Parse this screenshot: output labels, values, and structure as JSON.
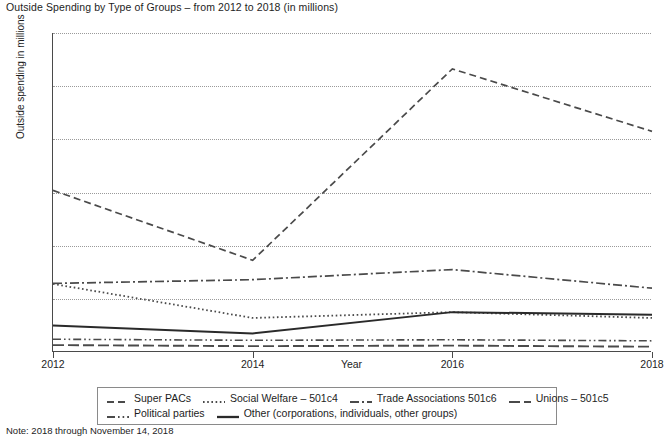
{
  "chart_data": {
    "type": "line",
    "title": "Outside Spending by Type of Groups – from 2012 to 2018 (in millions)",
    "xlabel": "Year",
    "ylabel": "Outside spending in millions",
    "note": "Note: 2018 through November 14, 2018",
    "x": [
      2012,
      2014,
      2016,
      2018
    ],
    "xlim": [
      2012,
      2018
    ],
    "ylim": [
      0,
      1200
    ],
    "x_ticks": [
      "2012",
      "2014",
      "2016",
      "2018"
    ],
    "y_ticks": [
      "$0",
      "$200",
      "$400",
      "$600",
      "$800",
      "$1000",
      "$1200"
    ],
    "y_tick_values": [
      0,
      200,
      400,
      600,
      800,
      1000,
      1200
    ],
    "grid": true,
    "legend_position": "bottom",
    "series": [
      {
        "name": "Super PACs",
        "style": "dashed",
        "color": "#4a4a4a",
        "values": [
          608,
          345,
          1065,
          830
        ]
      },
      {
        "name": "Social Welfare – 501c4",
        "style": "dotted",
        "color": "#4a4a4a",
        "values": [
          256,
          128,
          150,
          128
        ]
      },
      {
        "name": "Trade Associations 501c6",
        "style": "dash-dot",
        "color": "#4a4a4a",
        "values": [
          258,
          272,
          310,
          240
        ]
      },
      {
        "name": "Unions – 501c5",
        "style": "long-dash",
        "color": "#4a4a4a",
        "values": [
          26,
          22,
          24,
          20
        ]
      },
      {
        "name": "Political parties",
        "style": "dash-dot-dot",
        "color": "#4a4a4a",
        "values": [
          48,
          44,
          46,
          42
        ]
      },
      {
        "name": "Other (corporations, individuals, other groups)",
        "style": "solid",
        "color": "#2a2a2a",
        "values": [
          100,
          70,
          150,
          140
        ]
      }
    ]
  }
}
